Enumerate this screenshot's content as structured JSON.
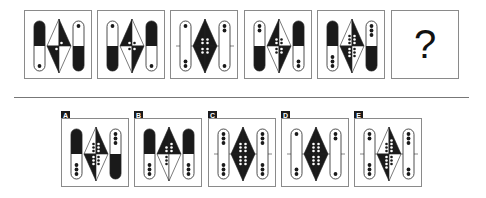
{
  "puzzle": {
    "question_mark": "?",
    "colors": {
      "dark": "#1a1a1a",
      "grey_dark": "#333333",
      "border": "#8a8a8a",
      "line": "#777777"
    },
    "sequence": [
      {
        "id": 1,
        "left_pill": {
          "top": "dark",
          "bottom": "white",
          "top_dots": 0,
          "bottom_dots": 1
        },
        "diamond": {
          "tl": "white",
          "tr": "dark",
          "bl": "dark",
          "br": "white",
          "tl_dots": 0,
          "tr_dots": 1,
          "bl_dots": 1,
          "br_dots": 0
        },
        "right_pill": {
          "top": "white",
          "bottom": "dark",
          "top_dots": 1,
          "bottom_dots": 0
        }
      },
      {
        "id": 2,
        "left_pill": {
          "top": "white",
          "bottom": "dark",
          "top_dots": 1,
          "bottom_dots": 0
        },
        "diamond": {
          "tl": "dark",
          "tr": "white",
          "bl": "white",
          "br": "dark",
          "tl_dots": 1,
          "tr_dots": 1,
          "bl_dots": 1,
          "br_dots": 1
        },
        "right_pill": {
          "top": "dark",
          "bottom": "white",
          "top_dots": 0,
          "bottom_dots": 1
        }
      },
      {
        "id": 3,
        "left_pill": {
          "top": "white",
          "bottom": "white",
          "top_dots": 1,
          "bottom_dots": 2
        },
        "diamond": {
          "tl": "dark",
          "tr": "dark",
          "bl": "dark",
          "br": "dark",
          "tl_dots": 2,
          "tr_dots": 2,
          "bl_dots": 2,
          "br_dots": 2
        },
        "right_pill": {
          "top": "white",
          "bottom": "white",
          "top_dots": 2,
          "bottom_dots": 1
        }
      },
      {
        "id": 4,
        "left_pill": {
          "top": "white",
          "bottom": "dark",
          "top_dots": 2,
          "bottom_dots": 0
        },
        "diamond": {
          "tl": "dark",
          "tr": "white",
          "bl": "white",
          "br": "dark",
          "tl_dots": 2,
          "tr_dots": 2,
          "bl_dots": 2,
          "br_dots": 2
        },
        "right_pill": {
          "top": "dark",
          "bottom": "white",
          "top_dots": 0,
          "bottom_dots": 2
        }
      },
      {
        "id": 5,
        "left_pill": {
          "top": "dark",
          "bottom": "white",
          "top_dots": 0,
          "bottom_dots": 3
        },
        "diamond": {
          "tl": "white",
          "tr": "dark",
          "bl": "dark",
          "br": "white",
          "tl_dots": 3,
          "tr_dots": 3,
          "bl_dots": 3,
          "br_dots": 3
        },
        "right_pill": {
          "top": "white",
          "bottom": "dark",
          "top_dots": 3,
          "bottom_dots": 0
        }
      }
    ],
    "options": [
      {
        "label": "A",
        "left_pill": {
          "top": "dark",
          "bottom": "white",
          "top_dots": 0,
          "bottom_dots": 3
        },
        "diamond": {
          "tl": "white",
          "tr": "dark",
          "bl": "dark",
          "br": "white",
          "tl_dots": 3,
          "tr_dots": 3,
          "bl_dots": 3,
          "br_dots": 3
        },
        "right_pill": {
          "top": "white",
          "bottom": "dark",
          "top_dots": 3,
          "bottom_dots": 0
        }
      },
      {
        "label": "B",
        "left_pill": {
          "top": "dark",
          "bottom": "white",
          "top_dots": 0,
          "bottom_dots": 3
        },
        "diamond": {
          "tl": "dark",
          "tr": "dark",
          "bl": "white",
          "br": "white",
          "tl_dots": 2,
          "tr_dots": 3,
          "bl_dots": 3,
          "br_dots": 0
        },
        "right_pill": {
          "top": "dark",
          "bottom": "white",
          "top_dots": 0,
          "bottom_dots": 3
        }
      },
      {
        "label": "C",
        "left_pill": {
          "top": "white",
          "bottom": "white",
          "top_dots": 3,
          "bottom_dots": 3
        },
        "diamond": {
          "tl": "dark",
          "tr": "dark",
          "bl": "dark",
          "br": "dark",
          "tl_dots": 3,
          "tr_dots": 3,
          "bl_dots": 3,
          "br_dots": 3
        },
        "right_pill": {
          "top": "white",
          "bottom": "white",
          "top_dots": 3,
          "bottom_dots": 3
        }
      },
      {
        "label": "D",
        "left_pill": {
          "top": "white",
          "bottom": "white",
          "top_dots": 1,
          "bottom_dots": 2
        },
        "diamond": {
          "tl": "dark",
          "tr": "dark",
          "bl": "dark",
          "br": "dark",
          "tl_dots": 3,
          "tr_dots": 3,
          "bl_dots": 3,
          "br_dots": 3
        },
        "right_pill": {
          "top": "white",
          "bottom": "white",
          "top_dots": 2,
          "bottom_dots": 1
        }
      },
      {
        "label": "E",
        "left_pill": {
          "top": "white",
          "bottom": "white",
          "top_dots": 2,
          "bottom_dots": 3
        },
        "diamond": {
          "tl": "white",
          "tr": "dark",
          "bl": "dark",
          "br": "white",
          "tl_dots": 3,
          "tr_dots": 4,
          "bl_dots": 4,
          "br_dots": 3
        },
        "right_pill": {
          "top": "white",
          "bottom": "white",
          "top_dots": 3,
          "bottom_dots": 2
        }
      }
    ]
  }
}
